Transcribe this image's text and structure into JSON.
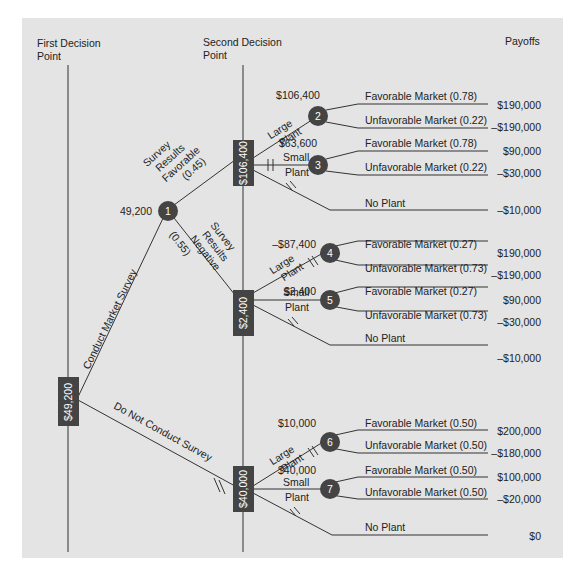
{
  "colors": {
    "panel": "#e4e4e4",
    "node": "#444444",
    "line": "#333333",
    "text": "#222222"
  },
  "headers": {
    "first": [
      "First Decision",
      "Point"
    ],
    "second": [
      "Second Decision",
      "Point"
    ],
    "payoffs": "Payoffs"
  },
  "decision_nodes": {
    "root": "$49,200",
    "fav": "$106,400",
    "neg": "$2,400",
    "nosurvey": "$40,000"
  },
  "chance_nodes": {
    "n1": {
      "num": "1",
      "ev": "49,200"
    },
    "n2": {
      "num": "2",
      "ev": "$106,400"
    },
    "n3": {
      "num": "3",
      "ev": "$63,600"
    },
    "n4": {
      "num": "4",
      "ev": "–$87,400"
    },
    "n5": {
      "num": "5",
      "ev": "$2,400"
    },
    "n6": {
      "num": "6",
      "ev": "$10,000"
    },
    "n7": {
      "num": "7",
      "ev": "$40,000"
    }
  },
  "branches": {
    "conduct": "Conduct Market Survey",
    "noconduct": "Do Not Conduct Survey",
    "fav": [
      "Survey",
      "Results",
      "Favorable",
      "(0.45)"
    ],
    "neg": [
      "Survey",
      "Results",
      "Negative",
      "(0.55)"
    ],
    "large": [
      "Large",
      "Plant"
    ],
    "small": [
      "Small",
      "Plant"
    ],
    "noplant": "No Plant"
  },
  "outcomes": {
    "g1": [
      {
        "label": "Favorable Market (0.78)",
        "payoff": "$190,000"
      },
      {
        "label": "Unfavorable Market (0.22)",
        "payoff": "–$190,000"
      },
      {
        "label": "Favorable Market (0.78)",
        "payoff": "$90,000"
      },
      {
        "label": "Unfavorable Market (0.22)",
        "payoff": "–$30,000"
      },
      {
        "label": "No Plant",
        "payoff": "–$10,000"
      }
    ],
    "g2": [
      {
        "label": "Favorable Market (0.27)",
        "payoff": "$190,000"
      },
      {
        "label": "Unfavorable Market (0.73)",
        "payoff": "–$190,000"
      },
      {
        "label": "Favorable Market (0.27)",
        "payoff": "$90,000"
      },
      {
        "label": "Unfavorable Market (0.73)",
        "payoff": "–$30,000"
      },
      {
        "label": "No Plant",
        "payoff": "–$10,000"
      }
    ],
    "g3": [
      {
        "label": "Favorable Market (0.50)",
        "payoff": "$200,000"
      },
      {
        "label": "Unfavorable Market (0.50)",
        "payoff": "–$180,000"
      },
      {
        "label": "Favorable Market (0.50)",
        "payoff": "$100,000"
      },
      {
        "label": "Unfavorable Market (0.50)",
        "payoff": "–$20,000"
      },
      {
        "label": "No Plant",
        "payoff": "$0"
      }
    ]
  }
}
